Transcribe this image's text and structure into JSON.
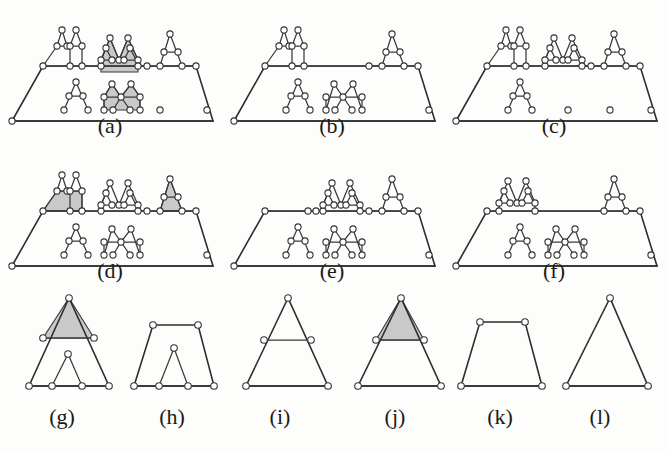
{
  "figure": {
    "title": "",
    "kind": "geometric-graph-diagram",
    "background_color": "#fdfdfb",
    "edge_color": "#3a3a3a",
    "node_fill_color": "#ffffff",
    "shade_color": "#c9c9c9",
    "panel_count": 12,
    "rows": 3,
    "cols": 4
  },
  "panels": [
    {
      "id": "a",
      "label": "(a)",
      "label_x": 110,
      "label_y": 127,
      "shaded": true,
      "shaded_count": 3,
      "description": "trapezoid outline with two interior tiers of triangular motifs; three shaded sub-regions"
    },
    {
      "id": "b",
      "label": "(b)",
      "label_x": 332,
      "label_y": 127,
      "shaded": false,
      "shaded_count": 0,
      "description": "trapezoid outline with two interior tiers of triangular motifs; no shading"
    },
    {
      "id": "c",
      "label": "(c)",
      "label_x": 554,
      "label_y": 127,
      "shaded": false,
      "shaded_count": 0,
      "description": "trapezoid outline with two interior tiers of triangular motifs; no shading"
    },
    {
      "id": "d",
      "label": "(d)",
      "label_x": 110,
      "label_y": 272,
      "shaded": true,
      "shaded_count": 2,
      "description": "trapezoid outline, upper tier has two shaded motifs (left and right)"
    },
    {
      "id": "e",
      "label": "(e)",
      "label_x": 332,
      "label_y": 272,
      "shaded": false,
      "shaded_count": 0,
      "description": "trapezoid outline with two interior tiers of triangular motifs; no shading"
    },
    {
      "id": "f",
      "label": "(f)",
      "label_x": 554,
      "label_y": 272,
      "shaded": false,
      "shaded_count": 0,
      "description": "trapezoid outline with two interior tiers of triangular motifs; no shading"
    },
    {
      "id": "g",
      "label": "(g)",
      "label_x": 62,
      "label_y": 418,
      "shaded": true,
      "shaded_count": 1,
      "description": "triangle with shaded apex cap and a small interior triangle on the base"
    },
    {
      "id": "h",
      "label": "(h)",
      "label_x": 172,
      "label_y": 418,
      "shaded": false,
      "shaded_count": 0,
      "description": "trapezoid with a small interior triangle on the base"
    },
    {
      "id": "i",
      "label": "(i)",
      "label_x": 280,
      "label_y": 418,
      "shaded": false,
      "shaded_count": 0,
      "description": "triangle with a horizontal mid-chord"
    },
    {
      "id": "j",
      "label": "(j)",
      "label_x": 395,
      "label_y": 418,
      "shaded": true,
      "shaded_count": 1,
      "description": "triangle with shaded apex cap above the mid-chord"
    },
    {
      "id": "k",
      "label": "(k)",
      "label_x": 500,
      "label_y": 418,
      "shaded": false,
      "shaded_count": 0,
      "description": "plain trapezoid"
    },
    {
      "id": "l",
      "label": "(l)",
      "label_x": 600,
      "label_y": 418,
      "shaded": false,
      "shaded_count": 0,
      "description": "plain triangle"
    }
  ],
  "legend": {
    "shaded_meaning": "shaded region",
    "node_meaning": "vertex marker (small open circle)"
  }
}
